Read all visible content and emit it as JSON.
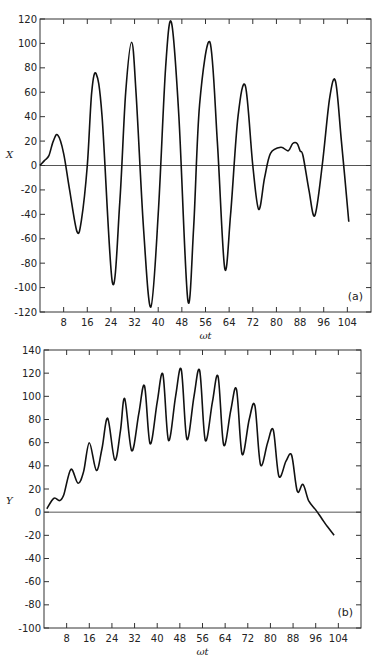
{
  "chart_data": [
    {
      "type": "line",
      "panel_label": "(a)",
      "title": "",
      "xlabel": "ωt",
      "ylabel": "X",
      "xlim": [
        0,
        112
      ],
      "ylim": [
        -120,
        120
      ],
      "xticks": [
        8,
        16,
        24,
        32,
        40,
        48,
        56,
        64,
        72,
        80,
        88,
        96,
        104
      ],
      "yticks": [
        -120,
        -100,
        -80,
        -60,
        -40,
        -20,
        0,
        20,
        40,
        60,
        80,
        100,
        120
      ],
      "grid": false,
      "zero_line": true,
      "series": [
        {
          "name": "X",
          "x": [
            0,
            1.5,
            3,
            4.5,
            6,
            8,
            10,
            12.5,
            14,
            16,
            17.5,
            19,
            21,
            24.5,
            27,
            29,
            31,
            32.5,
            35,
            37.5,
            40,
            42.5,
            44.5,
            47,
            50,
            52,
            54,
            57.5,
            60,
            62.5,
            64.5,
            67,
            69.5,
            72,
            74,
            76,
            78,
            81.5,
            84,
            85.5,
            87,
            88,
            89,
            91,
            93,
            95.5,
            98,
            100,
            102,
            104.5
          ],
          "values": [
            0,
            4,
            8,
            20,
            25,
            10,
            -20,
            -54,
            -45,
            0,
            60,
            75,
            40,
            -96,
            -30,
            60,
            101,
            60,
            -50,
            -116,
            -40,
            80,
            117,
            40,
            -110,
            -50,
            50,
            101,
            20,
            -84,
            -40,
            40,
            65,
            0,
            -36,
            -10,
            10,
            15,
            12,
            18,
            18,
            12,
            8,
            -20,
            -41,
            0,
            55,
            69,
            20,
            -46
          ]
        }
      ]
    },
    {
      "type": "line",
      "panel_label": "(b)",
      "title": "",
      "xlabel": "ωt",
      "ylabel": "Y",
      "xlim": [
        0,
        112
      ],
      "ylim": [
        -100,
        140
      ],
      "xticks": [
        8,
        16,
        24,
        32,
        40,
        48,
        56,
        64,
        72,
        80,
        88,
        96,
        104
      ],
      "yticks": [
        -100,
        -80,
        -60,
        -40,
        -20,
        0,
        20,
        40,
        60,
        80,
        100,
        120,
        140
      ],
      "grid": false,
      "zero_line": true,
      "series": [
        {
          "name": "Y",
          "x": [
            1,
            3.5,
            5.5,
            7,
            9.5,
            12,
            14,
            16,
            18.5,
            20.5,
            22.5,
            25,
            27,
            28.5,
            31,
            33.5,
            35.5,
            37.5,
            40,
            42,
            44,
            46.5,
            48.5,
            50.5,
            53,
            55,
            57,
            59.5,
            61.5,
            63.5,
            66,
            68,
            70,
            72.5,
            74.5,
            76.5,
            79,
            81,
            83,
            85.5,
            87.5,
            89.5,
            91.5,
            93.5,
            96,
            98,
            100,
            102.5
          ],
          "values": [
            3,
            12,
            10,
            15,
            37,
            25,
            35,
            60,
            36,
            55,
            81,
            45,
            70,
            98,
            53,
            85,
            109,
            59,
            95,
            119,
            62,
            100,
            123,
            63,
            100,
            122,
            62,
            95,
            117,
            58,
            88,
            106,
            50,
            80,
            92,
            41,
            60,
            71,
            31,
            44,
            49,
            18,
            24,
            10,
            2,
            -5,
            -12,
            -20
          ]
        }
      ]
    }
  ]
}
